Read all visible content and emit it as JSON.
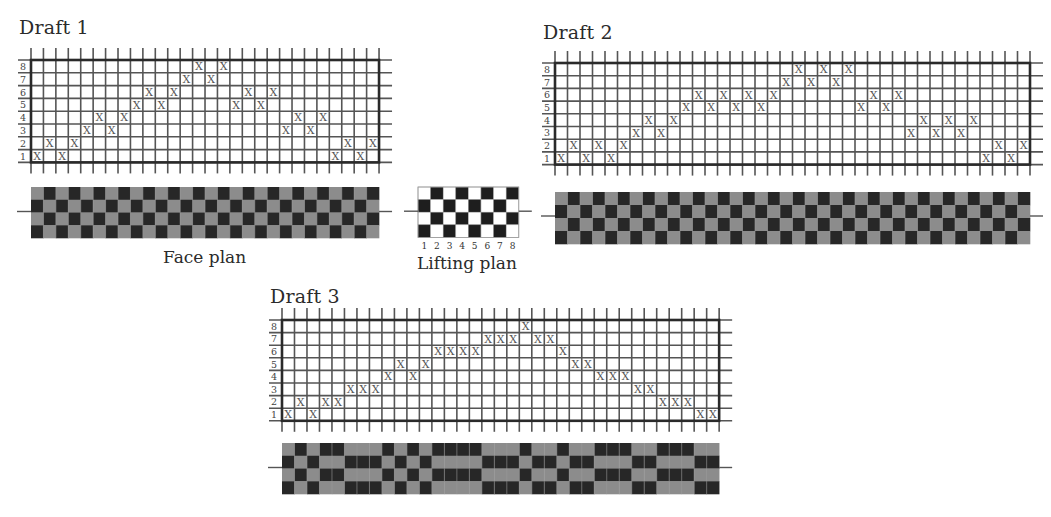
{
  "figure": {
    "lifting_plan_label": "Lifting plan",
    "face_plan_label": "Face plan",
    "colors": {
      "face_light": "#8c8c8c",
      "face_dark": "#272727",
      "lift_light": "#ffffff",
      "lift_dark": "#1e1e1e",
      "grid": "#555555",
      "frame": "#2a2a2a",
      "mark": "#555555"
    },
    "mark_glyph": "X",
    "lifting_plan": {
      "columns": [
        "1",
        "2",
        "3",
        "4",
        "5",
        "6",
        "7",
        "8"
      ],
      "rows_top_to_bottom": [
        [
          0,
          1,
          0,
          1,
          0,
          1,
          0,
          1
        ],
        [
          1,
          0,
          1,
          0,
          1,
          0,
          1,
          0
        ],
        [
          0,
          1,
          0,
          1,
          0,
          1,
          0,
          1
        ],
        [
          1,
          0,
          1,
          0,
          1,
          0,
          1,
          0
        ]
      ]
    },
    "drafts": [
      {
        "title": "Draft 1",
        "shaft_labels": [
          "1",
          "2",
          "3",
          "4",
          "5",
          "6",
          "7",
          "8"
        ],
        "ends": 28,
        "threading_shafts": [
          1,
          2,
          1,
          2,
          3,
          4,
          3,
          4,
          5,
          6,
          5,
          6,
          7,
          8,
          7,
          8,
          5,
          6,
          5,
          6,
          3,
          4,
          3,
          4,
          1,
          2,
          1,
          2
        ]
      },
      {
        "title": "Draft 2",
        "shaft_labels": [
          "1",
          "2",
          "3",
          "4",
          "5",
          "6",
          "7",
          "8"
        ],
        "ends": 38,
        "threading_shafts": [
          1,
          2,
          1,
          2,
          1,
          2,
          3,
          4,
          3,
          4,
          5,
          6,
          5,
          6,
          5,
          6,
          5,
          6,
          7,
          8,
          7,
          8,
          7,
          8,
          5,
          6,
          5,
          6,
          3,
          4,
          3,
          4,
          3,
          4,
          1,
          2,
          1,
          2
        ]
      },
      {
        "title": "Draft 3",
        "shaft_labels": [
          "1",
          "2",
          "3",
          "4",
          "5",
          "6",
          "7",
          "8"
        ],
        "ends": 35,
        "threading_shafts": [
          1,
          2,
          1,
          2,
          2,
          3,
          3,
          3,
          4,
          5,
          4,
          5,
          6,
          6,
          6,
          6,
          7,
          7,
          7,
          8,
          7,
          7,
          6,
          5,
          5,
          4,
          4,
          4,
          3,
          3,
          2,
          2,
          2,
          1,
          1
        ]
      }
    ]
  }
}
